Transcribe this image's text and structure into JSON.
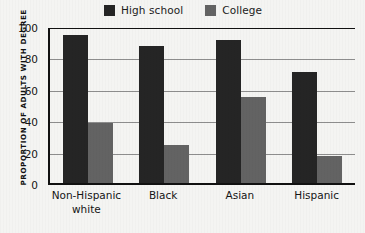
{
  "chart_data": {
    "type": "bar",
    "title": "",
    "xlabel": "",
    "ylabel": "PROPORTION OF ADULTS WITH DEGREE",
    "ylim": [
      0,
      100
    ],
    "yticks": [
      "0",
      "20",
      "40",
      "60",
      "80",
      "100"
    ],
    "grid": true,
    "legend_position": "top",
    "categories": [
      "Non-Hispanic white",
      "Black",
      "Asian",
      "Hispanic"
    ],
    "category_lines": [
      [
        "Non-Hispanic",
        "white"
      ],
      [
        "Black",
        ""
      ],
      [
        "Asian",
        ""
      ],
      [
        "Hispanic",
        ""
      ]
    ],
    "series": [
      {
        "name": "High school",
        "color": "#252525",
        "values": [
          94,
          87,
          91,
          71
        ]
      },
      {
        "name": "College",
        "color": "#636363",
        "values": [
          38,
          24,
          55,
          17
        ]
      }
    ]
  },
  "legend": {
    "items": [
      {
        "label": "High school",
        "color": "#252525"
      },
      {
        "label": "College",
        "color": "#636363"
      }
    ]
  },
  "colors": {
    "background": "#f4f4f2",
    "axis": "#111111",
    "grid": "#8d8d8d",
    "high_school": "#252525",
    "college": "#636363"
  }
}
